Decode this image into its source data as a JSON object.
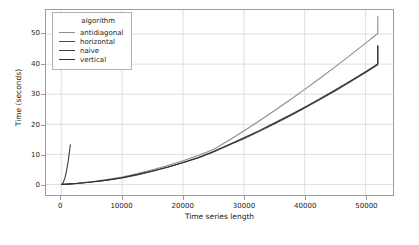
{
  "chart_data": {
    "type": "line",
    "title": "",
    "xlabel": "Time series length",
    "ylabel": "Time (seconds)",
    "xlim": [
      -2500,
      54500
    ],
    "ylim": [
      -3.5,
      58
    ],
    "grid": true,
    "legend_position": "upper-left-inside",
    "legend_title": "algorithm",
    "xticks": [
      0,
      10000,
      20000,
      30000,
      40000,
      50000
    ],
    "xtick_labels": [
      "0",
      "10000",
      "20000",
      "30000",
      "40000",
      "50000"
    ],
    "yticks": [
      0,
      10,
      20,
      30,
      40,
      50
    ],
    "ytick_labels": [
      "0",
      "10",
      "20",
      "30",
      "40",
      "50"
    ],
    "series": [
      {
        "name": "antidiagonal",
        "color": "#8d8d8d",
        "x": [
          100,
          500,
          1000,
          2500,
          5000,
          7500,
          10000,
          12500,
          15000,
          17500,
          20000,
          22500,
          25000,
          27500,
          30000,
          32500,
          35000,
          37500,
          40000,
          42500,
          45000,
          47500,
          50000,
          52000
        ],
        "y": [
          0.02,
          0.06,
          0.12,
          0.35,
          0.9,
          1.6,
          2.5,
          3.6,
          4.9,
          6.3,
          7.9,
          9.6,
          11.6,
          14.6,
          17.8,
          21.1,
          24.5,
          28.0,
          31.6,
          35.3,
          39.1,
          43.0,
          47.0,
          50.2
        ],
        "y_end": 55.8
      },
      {
        "name": "horizontal",
        "color": "#4a4a4a",
        "x": [
          100,
          500,
          1000,
          2500,
          5000,
          7500,
          10000,
          12500,
          15000,
          17500,
          20000,
          22500,
          25000,
          27500,
          30000,
          32500,
          35000,
          37500,
          40000,
          42500,
          45000,
          47500,
          50000,
          52000
        ],
        "y": [
          0.02,
          0.05,
          0.1,
          0.3,
          0.8,
          1.4,
          2.2,
          3.2,
          4.4,
          5.7,
          7.2,
          8.8,
          10.8,
          13.0,
          15.2,
          17.6,
          20.1,
          22.7,
          25.4,
          28.2,
          31.1,
          34.1,
          37.2,
          39.8
        ],
        "y_end": 45.9
      },
      {
        "name": "naive",
        "color": "#3a3a3a",
        "x": [
          100,
          300,
          600,
          900,
          1200,
          1500
        ],
        "y": [
          0.05,
          0.5,
          2.1,
          4.8,
          8.5,
          13.2
        ],
        "y_end": 13.2
      },
      {
        "name": "vertical",
        "color": "#2e2e2e",
        "x": [
          100,
          500,
          1000,
          2500,
          5000,
          7500,
          10000,
          12500,
          15000,
          17500,
          20000,
          22500,
          25000,
          27500,
          30000,
          32500,
          35000,
          37500,
          40000,
          42500,
          45000,
          47500,
          50000,
          52000
        ],
        "y": [
          0.02,
          0.05,
          0.1,
          0.31,
          0.82,
          1.45,
          2.25,
          3.3,
          4.5,
          5.8,
          7.3,
          9.0,
          11.0,
          13.2,
          15.5,
          17.9,
          20.4,
          23.0,
          25.7,
          28.5,
          31.4,
          34.4,
          37.5,
          40.1
        ],
        "y_end": 46.2
      }
    ]
  },
  "legend": {
    "title": "algorithm",
    "entries": [
      {
        "label": "antidiagonal",
        "color": "#8d8d8d"
      },
      {
        "label": "horizontal",
        "color": "#4a4a4a"
      },
      {
        "label": "naive",
        "color": "#3a3a3a"
      },
      {
        "label": "vertical",
        "color": "#2e2e2e"
      }
    ]
  },
  "axes": {
    "xlabel": "Time series length",
    "ylabel": "Time (seconds)"
  },
  "colors": {
    "grid": "#d6d6d6",
    "frame": "#9a9a9a",
    "background": "#ffffff",
    "text": "#1a1a1a"
  }
}
